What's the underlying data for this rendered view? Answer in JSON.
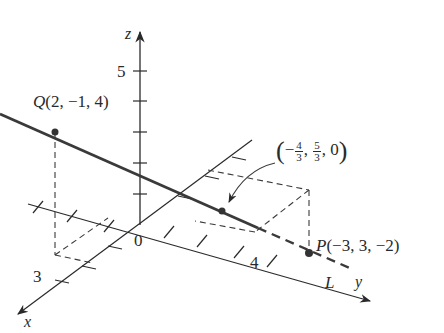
{
  "figure": {
    "type": "3D line through two points intersecting the xy-plane",
    "colors": {
      "axis": "#2a2a2a",
      "line": "#3a3a3a",
      "dashed": "#3a3a3a",
      "background": "#ffffff"
    }
  },
  "axes": {
    "x": {
      "label": "x",
      "tick_label": "3"
    },
    "y": {
      "label": "y",
      "tick_label": "4"
    },
    "z": {
      "label": "z",
      "tick_label": "5"
    },
    "origin_label": "0"
  },
  "points": {
    "Q": {
      "name": "Q",
      "coords": "(2, −1, 4)"
    },
    "P": {
      "name": "P",
      "coords": "(−3, 3, −2)"
    },
    "intersection": {
      "open": "(",
      "neg": "−",
      "x_num": "4",
      "x_den": "3",
      "comma1": ",",
      "y_num": "5",
      "y_den": "3",
      "rest": ", 0",
      "close": ")"
    }
  },
  "line": {
    "label": "L"
  }
}
